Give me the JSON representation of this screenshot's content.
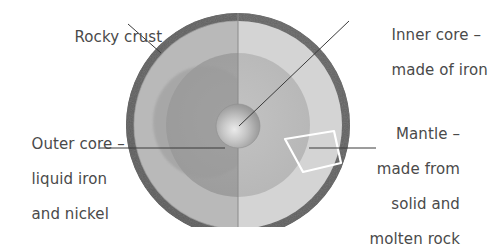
{
  "diagram": {
    "background_color": "#ffffff",
    "text_color": "#4a4a4a",
    "labels": {
      "crust": "Rocky crust",
      "inner_core_line1": "Inner core –",
      "inner_core_line2": "made of iron",
      "outer_core_line1": "Outer core –",
      "outer_core_line2": "liquid iron",
      "outer_core_line3": "and nickel",
      "mantle_line1": "Mantle –",
      "mantle_line2": "made from",
      "mantle_line3": "solid and",
      "mantle_line4": "molten rock"
    },
    "layers": [
      {
        "name": "crust",
        "label": "Rocky crust",
        "color_left": "#5d5d5d",
        "color_right": "#6e6e6e",
        "outer_radius": 112,
        "inner_radius": 104
      },
      {
        "name": "mantle",
        "label": "Mantle",
        "color_left": "#b9b9b9",
        "color_right": "#d2d2d2",
        "outer_radius": 104,
        "inner_radius": 72
      },
      {
        "name": "outer_core",
        "label": "Outer core",
        "color_left": "#a3a3a3",
        "color_right": "#bdbdbd",
        "outer_radius": 72,
        "inner_radius": 22
      },
      {
        "name": "inner_core",
        "label": "Inner core",
        "color_left": "#a8a8a8",
        "color_right": "#c6c6c6",
        "outer_radius": 22,
        "inner_radius": 0
      }
    ],
    "center": {
      "x": 238,
      "y": 125
    },
    "radius": 112,
    "divider": {
      "orientation": "vertical",
      "x": 238,
      "color": "#7a7a7a"
    },
    "highlight_wedge": {
      "name": "mantle-sample-wedge",
      "outline_color": "#ffffff"
    },
    "leader_lines": [
      {
        "name": "crust-leader",
        "x1": 128,
        "y1": 24,
        "x2": 161,
        "y2": 53
      },
      {
        "name": "inner-core-leader",
        "x1": 239,
        "y1": 126,
        "x2": 349,
        "y2": 21
      },
      {
        "name": "outer-core-leader",
        "x1": 100,
        "y1": 148,
        "x2": 225,
        "y2": 148
      },
      {
        "name": "mantle-leader",
        "x1": 309,
        "y1": 148,
        "x2": 376,
        "y2": 148
      }
    ]
  }
}
